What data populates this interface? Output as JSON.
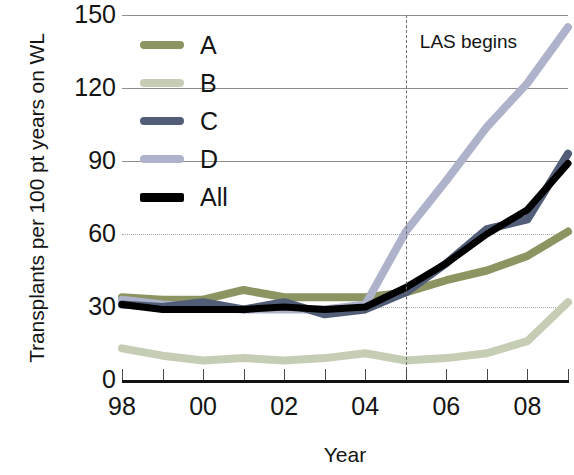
{
  "chart_data": {
    "type": "line",
    "title": "",
    "xlabel": "Year",
    "ylabel": "Transplants per 100 pt years on WL",
    "xlim": [
      1998,
      2009
    ],
    "ylim": [
      0,
      150
    ],
    "yticks": [
      0,
      30,
      60,
      90,
      120,
      150
    ],
    "xticks": [
      1998,
      1999,
      2000,
      2001,
      2002,
      2003,
      2004,
      2005,
      2006,
      2007,
      2008,
      2009
    ],
    "xtick_labels": [
      "98",
      "",
      "00",
      "",
      "02",
      "",
      "04",
      "",
      "06",
      "",
      "08",
      ""
    ],
    "grid": "horizontal",
    "legend_position": "upper-left-inside",
    "x": [
      1998,
      1999,
      2000,
      2001,
      2002,
      2003,
      2004,
      2005,
      2006,
      2007,
      2008,
      2009
    ],
    "series": [
      {
        "name": "A",
        "color": "#8c9462",
        "values": [
          34,
          33,
          33,
          37,
          34,
          34,
          34,
          36,
          41,
          45,
          51,
          61
        ]
      },
      {
        "name": "B",
        "color": "#c6cdb5",
        "values": [
          13,
          10,
          8,
          9,
          8,
          9,
          11,
          8,
          9,
          11,
          16,
          32
        ]
      },
      {
        "name": "C",
        "color": "#525d77",
        "values": [
          31,
          30,
          32,
          29,
          32,
          27,
          29,
          36,
          48,
          62,
          66,
          93
        ]
      },
      {
        "name": "D",
        "color": "#aeb3cb",
        "values": [
          33,
          31,
          30,
          29,
          29,
          29,
          31,
          61,
          82,
          104,
          122,
          145
        ]
      },
      {
        "name": "All",
        "color": "#000000",
        "values": [
          31,
          29,
          29,
          29,
          30,
          29,
          30,
          38,
          48,
          60,
          70,
          89
        ]
      }
    ],
    "annotations": [
      {
        "name": "las-begins",
        "text": "LAS begins",
        "x": 2005,
        "type": "vertical-dashed-line-with-label",
        "line_color": "#6e6e6e",
        "label_position": "right-top"
      }
    ]
  },
  "axis": {
    "y_title": "Transplants per 100 pt years on WL",
    "x_title": "Year",
    "y_tick_labels": [
      "150",
      "120",
      "90",
      "60",
      "30",
      "0"
    ],
    "x_tick_labels": [
      "98",
      "00",
      "02",
      "04",
      "06",
      "08"
    ]
  },
  "legend": {
    "items": [
      {
        "label": "A",
        "color": "#8c9462"
      },
      {
        "label": "B",
        "color": "#c6cdb5"
      },
      {
        "label": "C",
        "color": "#525d77"
      },
      {
        "label": "D",
        "color": "#aeb3cb"
      },
      {
        "label": "All",
        "color": "#000000"
      }
    ]
  }
}
